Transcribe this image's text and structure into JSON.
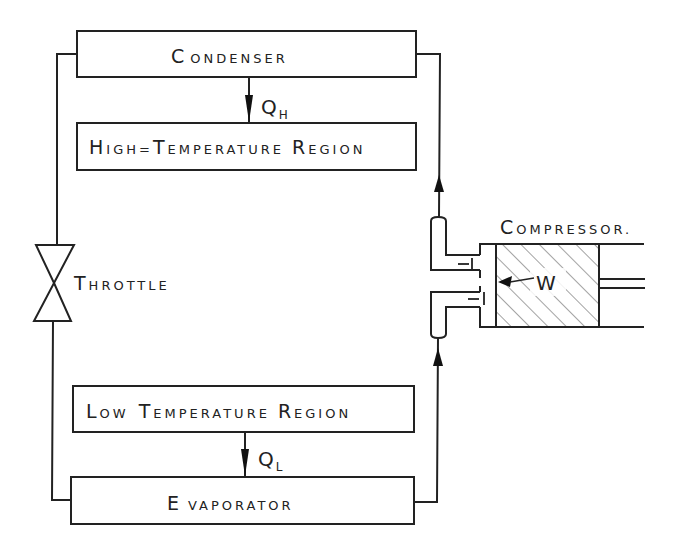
{
  "colors": {
    "line": "#222222",
    "background": "#ffffff",
    "hatch": "#555555"
  },
  "components": {
    "condenser": {
      "first": "C",
      "rest": "ONDENSER"
    },
    "high_temp_region": {
      "w1_first": "H",
      "w1_rest": "IGH",
      "sep": "=",
      "w2_first": "T",
      "w2_rest": "EMPERATURE",
      "w3_first": "R",
      "w3_rest": "EGION"
    },
    "low_temp_region": {
      "w1_first": "L",
      "w1_rest": "OW",
      "w2_first": "T",
      "w2_rest": "EMPERATURE",
      "w3_first": "R",
      "w3_rest": "EGION"
    },
    "evaporator": {
      "first": "E",
      "rest": "VAPORATOR"
    },
    "throttle": {
      "first": "T",
      "rest": "HROTTLE"
    },
    "compressor": {
      "first": "C",
      "rest": "OMPRESSOR."
    }
  },
  "heat_flows": {
    "q_high": {
      "symbol": "Q",
      "subscript": "H"
    },
    "q_low": {
      "symbol": "Q",
      "subscript": "L"
    }
  },
  "work": {
    "symbol": "W"
  },
  "valve_marks": {
    "upper": "—I",
    "lower": "—I"
  }
}
